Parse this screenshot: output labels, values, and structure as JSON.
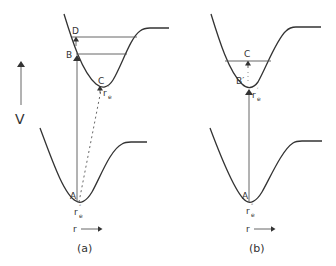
{
  "figure": {
    "axis": {
      "energy_label": "V",
      "distance_label": "r"
    },
    "panel_a": {
      "caption": "(a)",
      "labels": {
        "D": "D",
        "B": "B",
        "C": "C",
        "A": "A",
        "re_upper": "r",
        "re_upper_sub": "e",
        "re_upper_prime": "′",
        "re_lower": "r",
        "re_lower_sub": "e",
        "re_lower_prime": "″",
        "r_axis": "r"
      }
    },
    "panel_b": {
      "caption": "(b)",
      "labels": {
        "C": "C",
        "B": "B′",
        "A": "A",
        "re_upper": "r",
        "re_upper_sub": "e",
        "re_upper_prime": "′",
        "re_lower": "r",
        "re_lower_sub": "e",
        "re_lower_prime": "″",
        "r_axis": "r"
      }
    },
    "colors": {
      "ink": "#333333",
      "background": "#ffffff"
    }
  }
}
